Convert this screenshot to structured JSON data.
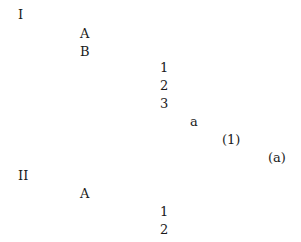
{
  "outline": [
    {
      "label": "I",
      "level": 0,
      "x": 18,
      "y": 7
    },
    {
      "label": "A",
      "level": 1,
      "x": 80,
      "y": 26
    },
    {
      "label": "B",
      "level": 1,
      "x": 80,
      "y": 44
    },
    {
      "label": "1",
      "level": 2,
      "x": 160,
      "y": 60
    },
    {
      "label": "2",
      "level": 2,
      "x": 160,
      "y": 78
    },
    {
      "label": "3",
      "level": 2,
      "x": 160,
      "y": 96
    },
    {
      "label": "a",
      "level": 3,
      "x": 190,
      "y": 114
    },
    {
      "label": "(1)",
      "level": 4,
      "x": 222,
      "y": 132
    },
    {
      "label": "(a)",
      "level": 5,
      "x": 268,
      "y": 150
    },
    {
      "label": "II",
      "level": 0,
      "x": 18,
      "y": 168
    },
    {
      "label": "A",
      "level": 1,
      "x": 80,
      "y": 186
    },
    {
      "label": "1",
      "level": 2,
      "x": 160,
      "y": 204
    },
    {
      "label": "2",
      "level": 2,
      "x": 160,
      "y": 222
    }
  ]
}
